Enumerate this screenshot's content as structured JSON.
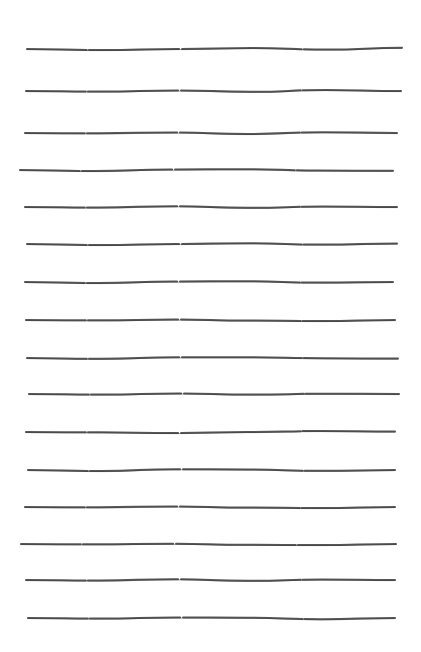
{
  "page": {
    "width": 421,
    "height": 652,
    "background": "#ffffff",
    "ink_color": "#3a3a3a"
  },
  "lines": [
    {
      "y": 49,
      "x1": 27,
      "x2": 402,
      "wave": [
        0,
        1,
        0,
        -1,
        0.5,
        -1.2
      ]
    },
    {
      "y": 91,
      "x1": 26,
      "x2": 401,
      "wave": [
        0,
        0.5,
        -0.6,
        0.8,
        -1,
        0
      ]
    },
    {
      "y": 133,
      "x1": 25,
      "x2": 397,
      "wave": [
        0,
        0.3,
        -0.6,
        1,
        -0.8,
        0
      ]
    },
    {
      "y": 170,
      "x1": 20,
      "x2": 393,
      "wave": [
        0,
        1,
        -0.5,
        -0.8,
        0.5,
        0.8
      ]
    },
    {
      "y": 207,
      "x1": 25,
      "x2": 397,
      "wave": [
        0,
        0.5,
        -0.8,
        0.8,
        -0.5,
        0
      ]
    },
    {
      "y": 244,
      "x1": 27,
      "x2": 397,
      "wave": [
        0,
        1,
        0,
        -0.8,
        0.6,
        -0.4
      ]
    },
    {
      "y": 282,
      "x1": 25,
      "x2": 393,
      "wave": [
        0,
        1,
        -0.5,
        -0.8,
        0.6,
        0
      ]
    },
    {
      "y": 320,
      "x1": 26,
      "x2": 395,
      "wave": [
        0,
        0.3,
        -0.5,
        0.5,
        1,
        0
      ]
    },
    {
      "y": 358,
      "x1": 27,
      "x2": 398,
      "wave": [
        0,
        0.8,
        -0.8,
        -0.8,
        0.2,
        0.6
      ]
    },
    {
      "y": 394,
      "x1": 29,
      "x2": 399,
      "wave": [
        0,
        0.5,
        -0.6,
        0.6,
        -0.3,
        0
      ]
    },
    {
      "y": 432,
      "x1": 26,
      "x2": 395,
      "wave": [
        0,
        0.3,
        1,
        0,
        -1,
        -0.5
      ]
    },
    {
      "y": 470,
      "x1": 28,
      "x2": 395,
      "wave": [
        0,
        1,
        -0.8,
        -0.5,
        0.8,
        0
      ]
    },
    {
      "y": 507,
      "x1": 25,
      "x2": 395,
      "wave": [
        0,
        0.3,
        -0.6,
        0.6,
        1,
        0
      ]
    },
    {
      "y": 544,
      "x1": 21,
      "x2": 396,
      "wave": [
        0,
        0.3,
        -0.3,
        0.8,
        1,
        0
      ]
    },
    {
      "y": 580,
      "x1": 26,
      "x2": 395,
      "wave": [
        0,
        0.5,
        -0.8,
        0.8,
        -0.5,
        0
      ]
    },
    {
      "y": 618,
      "x1": 28,
      "x2": 395,
      "wave": [
        0,
        0.5,
        -0.6,
        -0.3,
        1.2,
        0
      ]
    }
  ]
}
